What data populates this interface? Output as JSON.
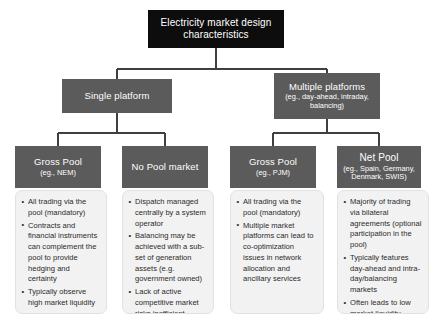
{
  "diagram": {
    "type": "hierarchy-tree",
    "colors": {
      "root_fill": "#0d0d0d",
      "branch_fill": "#5b5b5b",
      "node_text": "#ffffff",
      "panel_fill": "#f2f2f2",
      "panel_border": "#e2e2e2",
      "panel_text": "#2b2b2b",
      "connector": "#3f3f3f",
      "page_background": "#ffffff"
    },
    "root": {
      "title": "Electricity market design characteristics"
    },
    "level2": [
      {
        "id": "single-platform",
        "title": "Single platform",
        "subtitle": ""
      },
      {
        "id": "multiple-platforms",
        "title": "Multiple platforms",
        "subtitle": "(eg., day-ahead, intraday, balancing)"
      }
    ],
    "level3": [
      {
        "id": "gross-pool-nem",
        "parent": "single-platform",
        "title": "Gross Pool",
        "subtitle": "(eg., NEM)",
        "bullets": [
          "All trading via the pool (mandatory)",
          "Contracts and financial instruments can complement the pool to provide hedging and certainty",
          "Typically observe high market liquidity"
        ]
      },
      {
        "id": "no-pool-market",
        "parent": "single-platform",
        "title": "No Pool market",
        "subtitle": "",
        "bullets": [
          "Dispatch managed centrally by a system operator",
          "Balancing may be achieved with a sub-set of generation assets (e.g. government owned)",
          "Lack of active competitive market risks inefficient dispatch"
        ]
      },
      {
        "id": "gross-pool-pjm",
        "parent": "multiple-platforms",
        "title": "Gross Pool",
        "subtitle": "(eg., PJM)",
        "bullets": [
          "All trading via the pool (mandatory)",
          "Multiple market platforms can lead to co-optimization issues in network allocation and ancillary services"
        ]
      },
      {
        "id": "net-pool",
        "parent": "multiple-platforms",
        "title": "Net Pool",
        "subtitle": "(eg., Spain, Germany, Denmark, SWIS)",
        "bullets": [
          "Majority of trading via bilateral agreements (optional participation in the pool)",
          "Typically features day-ahead and intra-day/balancing markets",
          "Often leads to low market liquidity"
        ]
      }
    ]
  }
}
